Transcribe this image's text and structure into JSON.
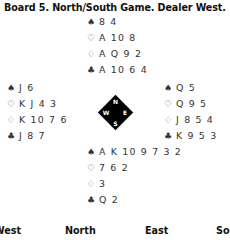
{
  "title": "Board 5. North/South Game. Dealer West.",
  "suits": {
    "spades": "♠",
    "hearts": "♡",
    "diamonds": "♢",
    "clubs": "♣"
  },
  "hands": {
    "north": {
      "spades": "8 4",
      "hearts": "A 10 8",
      "diamonds": "A Q 9 2",
      "clubs": "A 10 6 4"
    },
    "west": {
      "spades": "J 6",
      "hearts": "K J 4 3",
      "diamonds": "K 10 7 6",
      "clubs": "J 8 7"
    },
    "east": {
      "spades": "Q 5",
      "hearts": "Q 9 5",
      "diamonds": "J 8 5 4",
      "clubs": "K 9 5 3"
    },
    "south": {
      "spades": "A K 10 9 7 3 2",
      "hearts": "7 6 2",
      "diamonds": "3",
      "clubs": "Q 2"
    }
  },
  "compass": {
    "n": "N",
    "e": "E",
    "s": "S",
    "w": "W"
  },
  "bidding_header": [
    "West",
    "North",
    "East",
    "South"
  ]
}
